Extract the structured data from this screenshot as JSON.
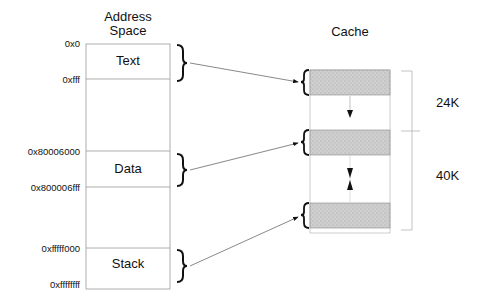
{
  "address_space": {
    "title_line1": "Address",
    "title_line2": "Space",
    "segments": [
      {
        "label": "Text",
        "start": "0x0",
        "end": "0xfff"
      },
      {
        "label": "Data",
        "start": "0x80006000",
        "end": "0x800006fff"
      },
      {
        "label": "Stack",
        "start": "0xfffff000",
        "end": "0xffffffff"
      }
    ]
  },
  "cache": {
    "title": "Cache",
    "sizes": [
      {
        "label": "24K"
      },
      {
        "label": "40K"
      }
    ]
  },
  "colors": {
    "line": "#888888",
    "cache_block": "#c8c8c8",
    "text": "#111111"
  }
}
